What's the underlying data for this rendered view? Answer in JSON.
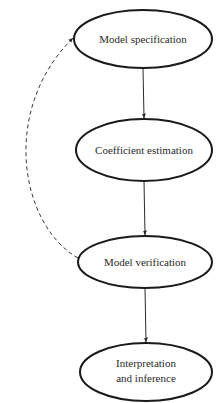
{
  "diagram": {
    "type": "flowchart",
    "nodes": [
      {
        "id": "n1",
        "label": "Model specification",
        "lines": [
          "Model specification"
        ],
        "cx": 143,
        "cy": 39,
        "rx": 69,
        "ry": 29
      },
      {
        "id": "n2",
        "label": "Coefficient estimation",
        "lines": [
          "Coefficient estimation"
        ],
        "cx": 144,
        "cy": 150,
        "rx": 68,
        "ry": 31
      },
      {
        "id": "n3",
        "label": "Model verification",
        "lines": [
          "Model verification"
        ],
        "cx": 145,
        "cy": 262,
        "rx": 67,
        "ry": 26
      },
      {
        "id": "n4",
        "label": "Interpretation and inference",
        "lines": [
          "Interpretation",
          "and inference"
        ],
        "cx": 146,
        "cy": 372,
        "rx": 66,
        "ry": 29
      }
    ],
    "edges": [
      {
        "from": "n1",
        "to": "n2",
        "style": "solid"
      },
      {
        "from": "n2",
        "to": "n3",
        "style": "solid"
      },
      {
        "from": "n3",
        "to": "n4",
        "style": "solid"
      },
      {
        "from": "n3",
        "to": "n1",
        "style": "dashed",
        "description": "feedback loop"
      }
    ]
  }
}
